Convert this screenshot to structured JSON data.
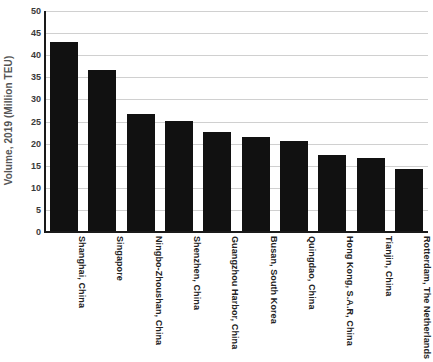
{
  "chart_data": {
    "type": "bar",
    "title": "",
    "xlabel": "",
    "ylabel": "Volume, 2019 (Million TEU)",
    "ylim": [
      0,
      50
    ],
    "yticks": [
      0,
      5,
      10,
      15,
      20,
      25,
      30,
      35,
      40,
      45,
      50
    ],
    "grid": true,
    "legend": null,
    "bar_color": "#111111",
    "gridline_color": "#d0d0d0",
    "axis_color": "#1a1a1a",
    "categories": [
      "Shanghai, China",
      "Singapore",
      "Ningbo-Zhoushan, China",
      "Shenzhen, China",
      "Guangzhou Harbor, China",
      "Busan, South Korea",
      "Quingdao, China",
      "Hong Kong, S.A.R, China",
      "Tianjin, China",
      "Rotterdam, The Netherlands"
    ],
    "values": [
      43.0,
      36.6,
      26.8,
      25.2,
      22.7,
      21.4,
      20.5,
      17.5,
      16.8,
      14.2
    ]
  }
}
